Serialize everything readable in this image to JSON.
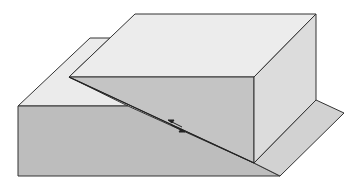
{
  "diagram": {
    "type": "block-diagram",
    "colors": {
      "background": "#ffffff",
      "top_surface": "#ebebeb",
      "front_face": "#bdbdbd",
      "upper_front_face": "#c4c4c4",
      "right_face": "#dcdcdc",
      "shelf": "#d2d2d2",
      "stroke": "#333333"
    },
    "annotations": {
      "fault_arrows": "opposing half-arrows indicating relative motion along fault trace"
    }
  }
}
